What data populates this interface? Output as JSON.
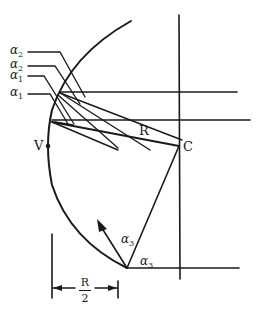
{
  "diagram": {
    "type": "geometric-optics-ray-diagram",
    "stroke_color": "#1a1a1a",
    "background": "#ffffff",
    "labels": {
      "alpha2_top": {
        "symbol": "α",
        "sub": "2"
      },
      "alpha2_second": {
        "symbol": "α",
        "sub": "2"
      },
      "alpha1_third": {
        "symbol": "α",
        "sub": "1"
      },
      "alpha1_fourth": {
        "symbol": "α",
        "sub": "1"
      },
      "alpha3_ray": {
        "symbol": "α",
        "sub": "3"
      },
      "alpha3_axis": {
        "symbol": "α",
        "sub": "3"
      },
      "vertex": "V",
      "center": "C",
      "radius": "R",
      "half_radius_num": "R",
      "half_radius_den": "2"
    },
    "points": {
      "V": [
        48,
        146
      ],
      "C": [
        179,
        146
      ],
      "bottom_incidence": [
        127,
        268
      ]
    }
  }
}
